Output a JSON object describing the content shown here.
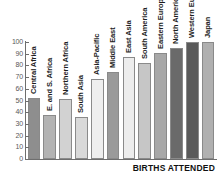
{
  "chart_data": {
    "type": "bar",
    "title": "",
    "subtitle": "",
    "xlabel": "BIRTHS ATTENDED",
    "ylabel": "",
    "ylim": [
      0,
      100
    ],
    "xlim": null,
    "grid": false,
    "legend": false,
    "legend_position": "none",
    "y_ticks": [
      0,
      10,
      20,
      30,
      40,
      50,
      60,
      70,
      80,
      90,
      100
    ],
    "y_tick_labels": [
      "0",
      "10",
      "20",
      "30",
      "40",
      "50",
      "60",
      "70",
      "80",
      "90",
      "100"
    ],
    "categories": [
      "Central Africa",
      "E. and S. Africa",
      "Northern Africa",
      "South Asia",
      "Asia-Pacific",
      "Middle East",
      "East Asia",
      "South America",
      "Eastern Europe",
      "North Americ",
      "Western Eur",
      "Japan"
    ],
    "values": [
      52,
      38,
      51,
      36,
      68,
      74,
      87,
      82,
      91,
      95,
      100,
      100
    ],
    "bar_colors": [
      "#8e8e8e",
      "#b3b3b3",
      "#d2d2d2",
      "#d9d9d9",
      "#eeeeee",
      "#9a9a9a",
      "#ededed",
      "#c6c6c6",
      "#a8a8a8",
      "#6a6a6a",
      "#5a5a5a",
      "#b0b0b0"
    ],
    "bar_edge_color": "#8a8a8a",
    "axis_color": "#6e6e6e",
    "tick_label_color": "#58585a",
    "category_label_color": "#1d1d1d",
    "background_color": "#ffffff"
  }
}
